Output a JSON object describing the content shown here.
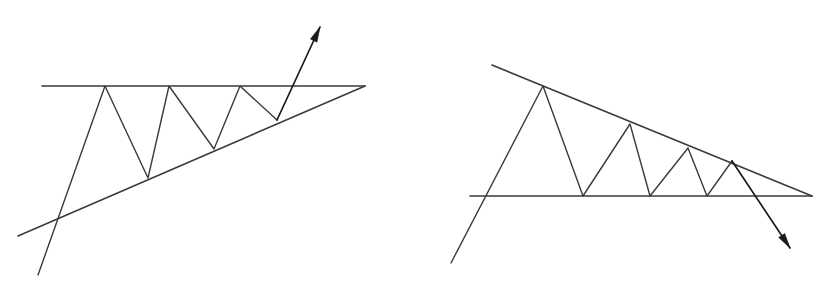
{
  "figure": {
    "background_color": "#ffffff",
    "stroke_color": "#3a3a3a",
    "arrow_color": "#1a1a1a",
    "canvas": {
      "width": 828,
      "height": 282
    }
  },
  "chart_data": {
    "type": "line",
    "subtitle": "",
    "xlabel": "",
    "ylabel": "",
    "grid": false,
    "legend": "none",
    "xlim": [
      0,
      828
    ],
    "ylim": [
      282,
      0
    ],
    "note": "Two hand-drawn technical-analysis price patterns: an ascending triangle with an upward breakout arrow (left) and a descending triangle with a downward breakdown arrow (right).",
    "panels": [
      {
        "name": "ascending-triangle",
        "label": "Ascending Triangle (bullish breakout)",
        "position": "left",
        "breakout_direction": "up",
        "resistance": {
          "name": "horizontal-resistance",
          "kind": "horizontal",
          "x": [
            42,
            365
          ],
          "y": [
            86,
            86
          ]
        },
        "support": {
          "name": "rising-support",
          "kind": "rising-trendline",
          "x": [
            18,
            365
          ],
          "y": [
            236,
            86
          ]
        },
        "price_path": {
          "name": "zigzag-price-path",
          "x": [
            38,
            105,
            148,
            169,
            214,
            240,
            277
          ],
          "y": [
            275,
            86,
            178,
            86,
            149,
            86,
            120
          ]
        },
        "breakout_arrow": {
          "name": "breakout-arrow-up",
          "from": [
            277,
            120
          ],
          "to": [
            320,
            27
          ]
        },
        "apex": [
          365,
          86
        ]
      },
      {
        "name": "descending-triangle",
        "label": "Descending Triangle (bearish breakdown)",
        "position": "right",
        "breakout_direction": "down",
        "resistance": {
          "name": "falling-resistance",
          "kind": "falling-trendline",
          "x": [
            492,
            812
          ],
          "y": [
            65,
            196
          ]
        },
        "support": {
          "name": "horizontal-support",
          "kind": "horizontal",
          "x": [
            470,
            812
          ],
          "y": [
            196,
            196
          ]
        },
        "price_path": {
          "name": "zigzag-price-path",
          "x": [
            451,
            543,
            583,
            630,
            650,
            688,
            707,
            732
          ],
          "y": [
            263,
            86,
            196,
            124,
            196,
            148,
            196,
            161
          ]
        },
        "breakdown_arrow": {
          "name": "breakdown-arrow-down",
          "from": [
            732,
            161
          ],
          "to": [
            790,
            248
          ]
        },
        "apex": [
          812,
          196
        ]
      }
    ]
  }
}
